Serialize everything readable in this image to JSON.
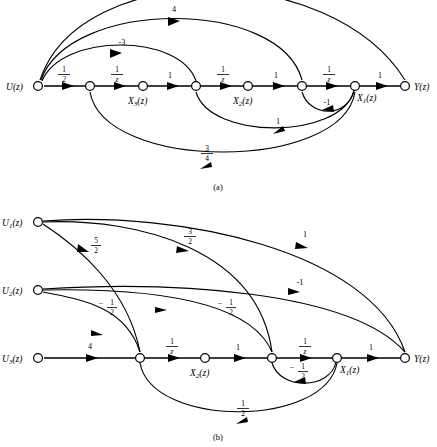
{
  "figure": {
    "panels": [
      {
        "id": "a",
        "caption": "(a)",
        "nodes": [
          {
            "id": "u",
            "label": "U(z)",
            "label_side": "left",
            "x": 38,
            "y": 86
          },
          {
            "id": "n1",
            "label": "",
            "label_side": "none",
            "x": 90,
            "y": 86
          },
          {
            "id": "x3",
            "label": "X_3(z)",
            "label_side": "below",
            "x": 143,
            "y": 86
          },
          {
            "id": "n2",
            "label": "",
            "label_side": "none",
            "x": 196,
            "y": 86
          },
          {
            "id": "x2",
            "label": "X_2(z)",
            "label_side": "below",
            "x": 248,
            "y": 86
          },
          {
            "id": "n3",
            "label": "",
            "label_side": "none",
            "x": 302,
            "y": 86
          },
          {
            "id": "x1",
            "label": "X_1(z)",
            "label_side": "below",
            "x": 355,
            "y": 86
          },
          {
            "id": "y",
            "label": "Y(z)",
            "label_side": "right",
            "x": 405,
            "y": 86
          }
        ],
        "forward_gains": [
          {
            "from": "u",
            "to": "n1",
            "gain": "1/2"
          },
          {
            "from": "n1",
            "to": "x3",
            "gain": "1/z"
          },
          {
            "from": "x3",
            "to": "n2",
            "gain": "1"
          },
          {
            "from": "n2",
            "to": "x2",
            "gain": "1/z"
          },
          {
            "from": "x2",
            "to": "n3",
            "gain": "1"
          },
          {
            "from": "n3",
            "to": "x1",
            "gain": "1/z"
          },
          {
            "from": "x1",
            "to": "y",
            "gain": "1"
          }
        ],
        "feedforward_arcs": [
          {
            "from": "u",
            "to": "y",
            "gain": "",
            "note": "outermost arc, clipped at top"
          },
          {
            "from": "u",
            "to": "n3",
            "gain": "4"
          },
          {
            "from": "u",
            "to": "n2",
            "gain": "-3"
          }
        ],
        "feedback_arcs": [
          {
            "from": "x1",
            "to": "n3",
            "gain": "-1"
          },
          {
            "from": "x1",
            "to": "n2",
            "gain": "1"
          },
          {
            "from": "x1",
            "to": "n1",
            "gain": "3/4"
          }
        ]
      },
      {
        "id": "b",
        "caption": "(b)",
        "nodes": [
          {
            "id": "u1",
            "label": "U_1(z)",
            "label_side": "left",
            "x": 38,
            "y": 222
          },
          {
            "id": "u2",
            "label": "U_2(z)",
            "label_side": "left",
            "x": 38,
            "y": 290
          },
          {
            "id": "u3",
            "label": "U_3(z)",
            "label_side": "left",
            "x": 38,
            "y": 358
          },
          {
            "id": "nb1",
            "label": "",
            "label_side": "none",
            "x": 140,
            "y": 358
          },
          {
            "id": "x2b",
            "label": "X_2(z)",
            "label_side": "below",
            "x": 205,
            "y": 358
          },
          {
            "id": "nb2",
            "label": "",
            "label_side": "none",
            "x": 272,
            "y": 358
          },
          {
            "id": "x1b",
            "label": "X_1(z)",
            "label_side": "below",
            "x": 337,
            "y": 358
          },
          {
            "id": "yb",
            "label": "Y(z)",
            "label_side": "right",
            "x": 405,
            "y": 358
          }
        ],
        "forward_gains": [
          {
            "from": "u3",
            "to": "nb1",
            "gain": "4"
          },
          {
            "from": "nb1",
            "to": "x2b",
            "gain": "1/z"
          },
          {
            "from": "x2b",
            "to": "nb2",
            "gain": "1"
          },
          {
            "from": "nb2",
            "to": "x1b",
            "gain": "1/z"
          },
          {
            "from": "x1b",
            "to": "yb",
            "gain": "1"
          }
        ],
        "input_arcs": [
          {
            "from": "u1",
            "to": "yb",
            "gain": "1"
          },
          {
            "from": "u1",
            "to": "nb2",
            "gain": "3/2"
          },
          {
            "from": "u1",
            "to": "nb1",
            "gain": "5/2"
          },
          {
            "from": "u2",
            "to": "yb",
            "gain": "-1"
          },
          {
            "from": "u2",
            "to": "nb2",
            "gain": "-1/2"
          },
          {
            "from": "u2",
            "to": "nb1",
            "gain": "-1/2"
          }
        ],
        "feedback_arcs": [
          {
            "from": "x1b",
            "to": "nb2",
            "gain": "-1/2"
          },
          {
            "from": "x1b",
            "to": "nb1",
            "gain": "1/2"
          }
        ]
      }
    ]
  }
}
